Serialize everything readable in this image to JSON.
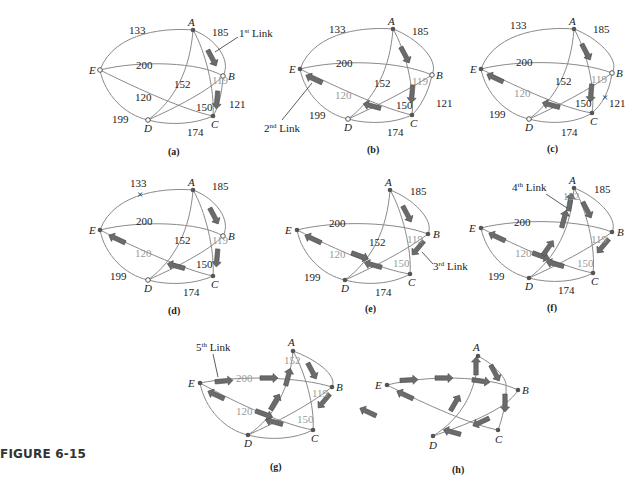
{
  "figure": {
    "label": "FIGURE 6-15"
  },
  "nodes": [
    "A",
    "B",
    "C",
    "D",
    "E"
  ],
  "edge_weights": {
    "A-E": "133",
    "A-B": "185",
    "E-B": "200",
    "A-D": "152",
    "A-C": "119",
    "E-C": "120",
    "D-B": "150",
    "B-C": "121",
    "E-D": "199",
    "D-C": "174"
  },
  "panels": [
    {
      "id": "a",
      "caption": "(a)",
      "callout": {
        "text": "1",
        "sup": "st",
        "rest": " Link"
      }
    },
    {
      "id": "b",
      "caption": "(b)",
      "callout": {
        "text": "2",
        "sup": "nd",
        "rest": " Link"
      }
    },
    {
      "id": "c",
      "caption": "(c)"
    },
    {
      "id": "d",
      "caption": "(d)"
    },
    {
      "id": "e",
      "caption": "(e)",
      "callout": {
        "text": "3",
        "sup": "rd",
        "rest": " Link"
      }
    },
    {
      "id": "f",
      "caption": "(f)",
      "callout": {
        "text": "4",
        "sup": "th",
        "rest": " Link"
      }
    },
    {
      "id": "g",
      "caption": "(g)",
      "callout": {
        "text": "5",
        "sup": "th",
        "rest": " Link"
      }
    },
    {
      "id": "h",
      "caption": "(h)"
    }
  ],
  "removed_marks": {
    "symbol": "×",
    "c": "121",
    "d": "133"
  },
  "colors": {
    "edge": "#8a8a8a",
    "arrow": "#6b6b6b",
    "text": "#222222",
    "highlight_text": "#9a9a9a"
  }
}
